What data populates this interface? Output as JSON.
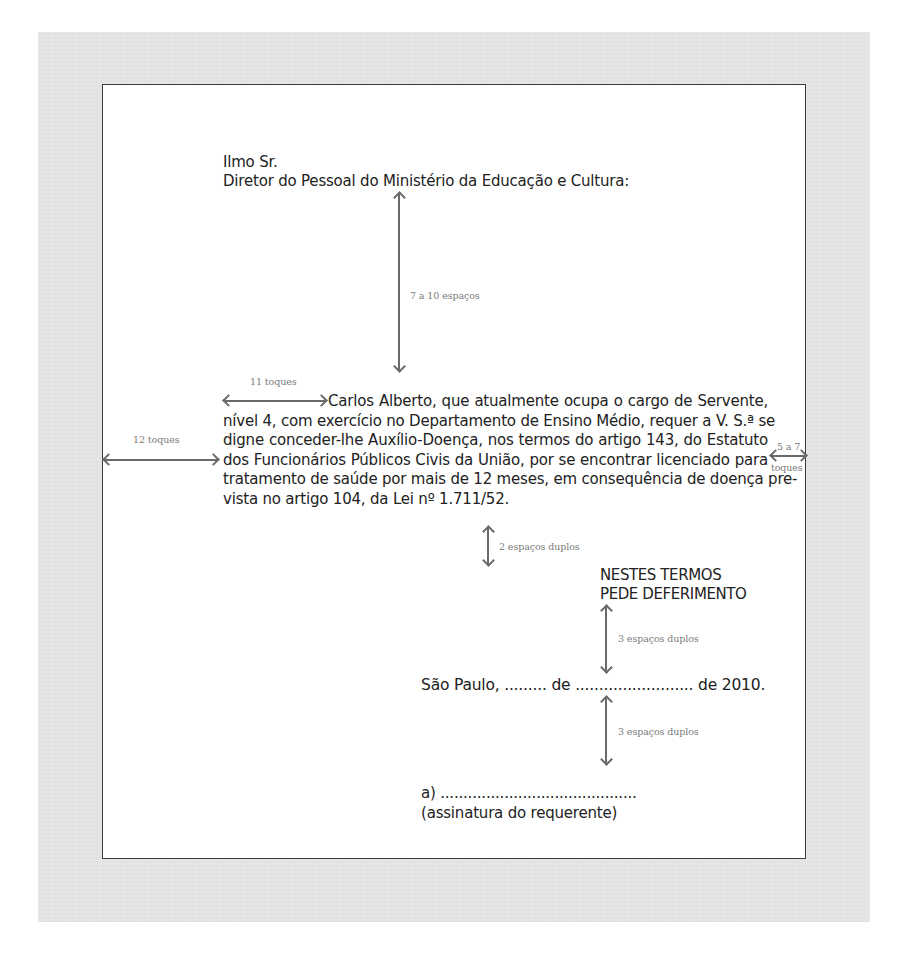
{
  "document": {
    "salutation": "Ilmo Sr.",
    "addressee": "Diretor do Pessoal do Ministério da Educação e Cultura:",
    "body_first_line": "Carlos Alberto, que atualmente ocupa o cargo de Servente,",
    "body_rest": "nível 4, com exercício no Departamento de Ensino Médio, requer a V. S.ª se digne conceder-lhe Auxílio-Doença, nos termos do artigo 143, do Estatuto dos Funcionários Públicos Civis da União, por se encontrar licenciado para tratamento de saúde por mais de 12 meses, em consequência de doença pre-vista no artigo 104, da Lei nº 1.711/52.",
    "body_lines": [
      "Carlos Alberto, que atualmente ocupa o cargo de Servente,",
      "nível 4, com exercício no Departamento de Ensino Médio, requer a V. S.ª se",
      "digne conceder-lhe Auxílio-Doença, nos termos do artigo 143, do Estatuto",
      "dos Funcionários Públicos Civis da União, por se encontrar licenciado para",
      "tratamento de saúde por mais de 12 meses, em consequência de doença pre-",
      "vista no artigo 104, da Lei nº 1.711/52."
    ],
    "closing_line_1": "NESTES TERMOS",
    "closing_line_2": "PEDE DEFERIMENTO",
    "place_date": "São Paulo, ......... de ......................... de 2010.",
    "signature_line": "a) ...........................................",
    "signature_caption": "(assinatura do requerente)"
  },
  "annotations": {
    "spacing_top": "7 a 10 espaços",
    "indent": "11 toques",
    "left_margin": "12 toques",
    "right_margin_line1": "5 a 7",
    "right_margin_line2": "toques",
    "spacing_after_body": "2 espaços duplos",
    "spacing_after_closing": "3 espaços duplos",
    "spacing_after_date": "3 espaços duplos"
  },
  "colors": {
    "frame_background": "#e4e4e4",
    "page_background": "#ffffff",
    "page_border": "#3a3a3a",
    "text": "#222222",
    "annotation_text": "#7a7a7a",
    "arrow": "#6a6a6a"
  }
}
